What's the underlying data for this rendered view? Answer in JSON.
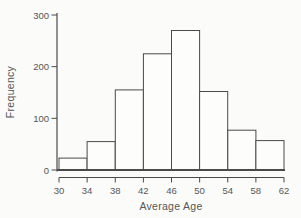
{
  "figure": {
    "background": "#fbfbf9",
    "line_color": "#4a4a4a",
    "text_color": "#565656",
    "bar_fill": "#fdfdfc"
  },
  "chart_data": {
    "type": "bar",
    "subtype": "histogram",
    "title": "",
    "xlabel": "Average Age",
    "ylabel": "Frequency",
    "bin_edges": [
      30,
      34,
      38,
      42,
      46,
      50,
      54,
      58,
      62
    ],
    "values": [
      23,
      55,
      155,
      225,
      270,
      152,
      77,
      57
    ],
    "xticks": [
      30,
      34,
      38,
      42,
      46,
      50,
      54,
      58,
      62
    ],
    "yticks": [
      0,
      100,
      200,
      300
    ],
    "xlim": [
      30,
      62
    ],
    "ylim": [
      0,
      300
    ],
    "grid": false,
    "legend": null
  }
}
